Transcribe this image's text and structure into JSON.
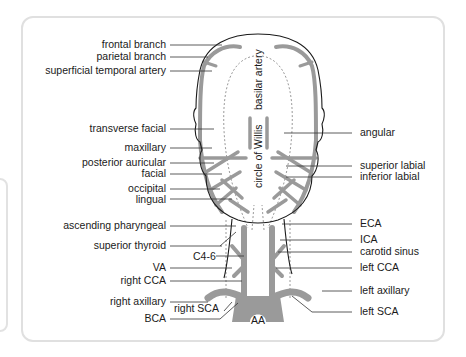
{
  "diagram": {
    "colors": {
      "artery": "#9a9a9a",
      "outline": "#1a1a1a",
      "leader": "#333333",
      "card_border": "#e0e0e0",
      "text": "#1a1a1a"
    },
    "labels_left": [
      {
        "id": "frontal-branch",
        "text": "frontal branch"
      },
      {
        "id": "parietal-branch",
        "text": "parietal branch"
      },
      {
        "id": "superficial-temporal-artery",
        "text": "superficial temporal artery"
      },
      {
        "id": "transverse-facial",
        "text": "transverse facial"
      },
      {
        "id": "maxillary",
        "text": "maxillary"
      },
      {
        "id": "posterior-auricular",
        "text": "posterior auricular"
      },
      {
        "id": "facial",
        "text": "facial"
      },
      {
        "id": "occipital",
        "text": "occipital"
      },
      {
        "id": "lingual",
        "text": "lingual"
      },
      {
        "id": "ascending-pharyngeal",
        "text": "ascending pharyngeal"
      },
      {
        "id": "superior-thyroid",
        "text": "superior thyroid"
      },
      {
        "id": "va",
        "text": "VA"
      },
      {
        "id": "right-cca",
        "text": "right CCA"
      },
      {
        "id": "right-axillary",
        "text": "right axillary"
      },
      {
        "id": "bca",
        "text": "BCA"
      }
    ],
    "labels_right": [
      {
        "id": "angular",
        "text": "angular"
      },
      {
        "id": "superior-labial",
        "text": "superior labial"
      },
      {
        "id": "inferior-labial",
        "text": "inferior labial"
      },
      {
        "id": "eca",
        "text": "ECA"
      },
      {
        "id": "ica",
        "text": "ICA"
      },
      {
        "id": "carotid-sinus",
        "text": "carotid sinus"
      },
      {
        "id": "left-cca",
        "text": "left CCA"
      },
      {
        "id": "left-axillary",
        "text": "left axillary"
      },
      {
        "id": "left-sca",
        "text": "left SCA"
      }
    ],
    "labels_inner": {
      "basilar_artery": "basilar artery",
      "circle_of_willis": "circle of Willis",
      "c4_6": "C4-6",
      "right_sca": "right SCA",
      "aa": "AA"
    }
  }
}
